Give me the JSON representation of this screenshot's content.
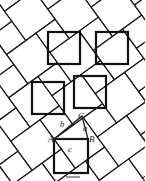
{
  "figure": {
    "type": "pythagorean-tessellation-proof",
    "background_color": "#ffffff",
    "thin_stroke_color": "#1a1a1a",
    "thick_stroke_color": "#111111",
    "thin_stroke_width": 1.1,
    "thick_stroke_width": 2.2,
    "tilt_angle_deg": 36,
    "labels": {
      "vertex_a": "A",
      "vertex_b": "B",
      "vertex_c": "C",
      "side_a": "a",
      "side_b": "b",
      "side_c": "c"
    },
    "label_positions": {
      "vertex_a": {
        "x": 48,
        "y": 142
      },
      "vertex_b": {
        "x": 89,
        "y": 142
      },
      "vertex_c": {
        "x": 78,
        "y": 119
      },
      "side_a": {
        "x": 83,
        "y": 131
      },
      "side_b": {
        "x": 60,
        "y": 127
      },
      "side_c": {
        "x": 68,
        "y": 152
      }
    },
    "c_square": {
      "x": 54,
      "y": 139,
      "size": 34
    },
    "triangle": {
      "A": {
        "x": 54,
        "y": 139
      },
      "B": {
        "x": 88,
        "y": 139
      },
      "C": {
        "x": 82,
        "y": 116
      }
    },
    "thick_squares": [
      {
        "x": 48,
        "y": 32,
        "size": 32
      },
      {
        "x": 96,
        "y": 32,
        "size": 32
      },
      {
        "x": 32,
        "y": 82,
        "size": 32
      },
      {
        "x": 74,
        "y": 76,
        "size": 32
      },
      {
        "x": 54,
        "y": 139,
        "size": 34
      }
    ],
    "caption_mark": {
      "x": 66,
      "y": 176,
      "width": 14,
      "height": 2,
      "color": "#9a9a9a"
    }
  }
}
